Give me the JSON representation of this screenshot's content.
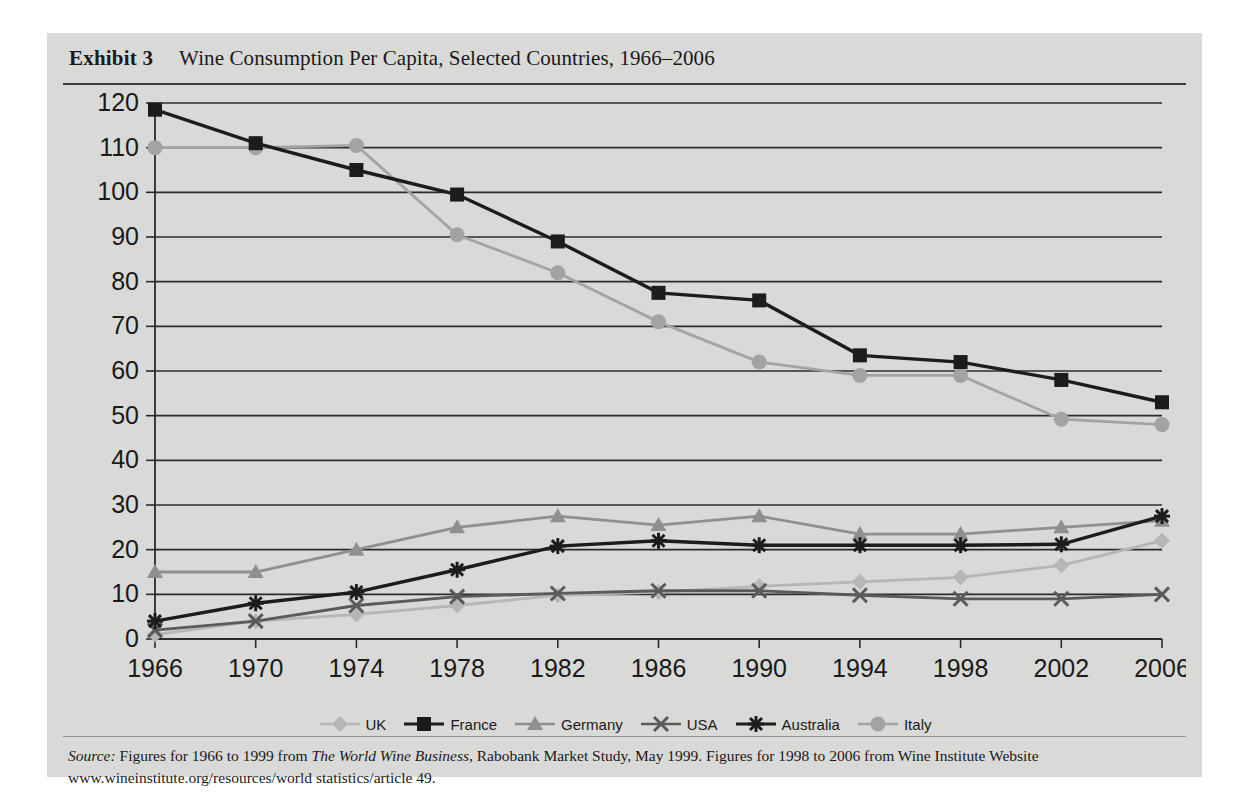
{
  "exhibit": {
    "label": "Exhibit 3",
    "title": "Wine Consumption Per Capita, Selected Countries, 1966–2006"
  },
  "source": {
    "prefix": "Source:",
    "text_1": " Figures for 1966 to 1999 from ",
    "italic_title": "The World Wine Business",
    "text_2": ", Rabobank Market Study, May 1999. Figures for 1998 to 2006 from Wine Institute Website www.wineinstitute.org/resources/world statistics/article 49."
  },
  "legend": {
    "items": [
      {
        "label": "UK",
        "marker": "diamond-marker",
        "color": "#b6b6b4"
      },
      {
        "label": "France",
        "marker": "square-marker",
        "color": "#1c1c1c"
      },
      {
        "label": "Germany",
        "marker": "triangle-marker",
        "color": "#8f8f8d"
      },
      {
        "label": "USA",
        "marker": "cross-marker",
        "color": "#5a5a58"
      },
      {
        "label": "Australia",
        "marker": "star-marker",
        "color": "#1c1c1c"
      },
      {
        "label": "Italy",
        "marker": "circle-marker",
        "color": "#a3a3a1"
      }
    ]
  },
  "chart_data": {
    "type": "line",
    "title": "Wine Consumption Per Capita, Selected Countries, 1966–2006",
    "xlabel": "",
    "ylabel": "",
    "categories": [
      1966,
      1970,
      1974,
      1978,
      1982,
      1986,
      1990,
      1994,
      1998,
      2002,
      2006
    ],
    "tick_labels_x": [
      "1966",
      "1970",
      "1974",
      "1978",
      "1982",
      "1986",
      "1990",
      "1994",
      "1998",
      "2002",
      "2006"
    ],
    "tick_labels_y": [
      "0",
      "10",
      "20",
      "30",
      "40",
      "50",
      "60",
      "70",
      "80",
      "90",
      "100",
      "110",
      "120"
    ],
    "ylim": [
      0,
      120
    ],
    "ytick_step": 10,
    "grid": true,
    "legend_position": "bottom",
    "series": [
      {
        "name": "UK",
        "marker": "diamond",
        "color": "#b6b6b4",
        "values": [
          1,
          4,
          5.5,
          7.5,
          9.8,
          10.5,
          11.8,
          12.8,
          13.8,
          16.5,
          22
        ]
      },
      {
        "name": "France",
        "marker": "square",
        "color": "#1c1c1c",
        "values": [
          118.5,
          111,
          105,
          99.5,
          89,
          77.5,
          75.8,
          63.5,
          62,
          58,
          53
        ]
      },
      {
        "name": "Germany",
        "marker": "triangle",
        "color": "#8f8f8d",
        "values": [
          15,
          15,
          20,
          25,
          27.5,
          25.5,
          27.5,
          23.5,
          23.5,
          25,
          26.5
        ]
      },
      {
        "name": "USA",
        "marker": "cross",
        "color": "#5a5a58",
        "values": [
          2,
          4,
          7.5,
          9.5,
          10.2,
          10.8,
          10.8,
          9.8,
          9,
          9,
          10
        ]
      },
      {
        "name": "Australia",
        "marker": "star",
        "color": "#1c1c1c",
        "values": [
          4,
          8,
          10.5,
          15.5,
          20.8,
          22,
          21,
          21,
          21,
          21.2,
          27.5
        ]
      },
      {
        "name": "Italy",
        "marker": "circle",
        "color": "#a3a3a1",
        "values": [
          110,
          110,
          110.5,
          90.5,
          82,
          71,
          62,
          59,
          59,
          49.2,
          48
        ]
      }
    ]
  }
}
